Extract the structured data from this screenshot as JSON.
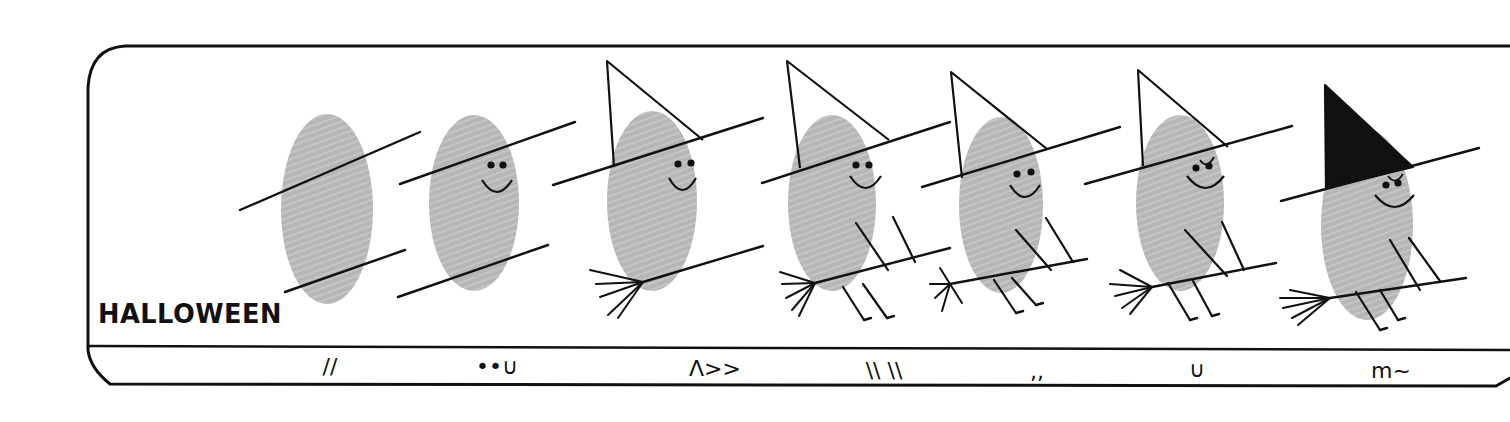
{
  "title": "HALLOWEEN",
  "colors": {
    "ink": "#111111",
    "thumbprint": "#b6b6b6",
    "paper": "#ffffff",
    "hat_dark": "#111111"
  },
  "frame": {
    "top_y": 46,
    "divider_y": 346,
    "bottom_y": 386,
    "left_x": 88,
    "right_x": 1510
  },
  "steps": [
    {
      "index": 1,
      "caption_glyph": "//",
      "print": {
        "cx": 327,
        "cy": 209,
        "rx": 46,
        "ry": 95
      },
      "lines": [
        [
          240,
          210,
          420,
          132
        ],
        [
          285,
          292,
          405,
          250
        ]
      ],
      "caption_pos": [
        330,
        368
      ],
      "face": null,
      "hat": null,
      "broom": null,
      "legs": null
    },
    {
      "index": 2,
      "caption_glyph": "••∪",
      "print": {
        "cx": 474,
        "cy": 203,
        "rx": 45,
        "ry": 88
      },
      "lines": [
        [
          400,
          184,
          575,
          122
        ],
        [
          398,
          297,
          548,
          245
        ]
      ],
      "caption_pos": [
        497,
        368
      ],
      "face": {
        "eyes": [
          [
            491,
            165
          ],
          [
            503,
            165
          ]
        ],
        "smile": [
          482,
          180,
          512,
          180
        ]
      },
      "hat": null,
      "broom": null,
      "legs": null
    },
    {
      "index": 3,
      "caption_glyph": "Λ>>",
      "print": {
        "cx": 652,
        "cy": 201,
        "rx": 45,
        "ry": 90
      },
      "lines": [
        [
          553,
          185,
          763,
          118
        ],
        [
          643,
          282,
          763,
          246
        ]
      ],
      "caption_pos": [
        715,
        370
      ],
      "face": {
        "eyes": [
          [
            678,
            164
          ],
          [
            691,
            163
          ]
        ],
        "smile": [
          669,
          178,
          696,
          178
        ]
      },
      "hat": {
        "apex": [
          607,
          61
        ],
        "left": [
          614,
          167
        ],
        "right": [
          703,
          140
        ],
        "filled": false
      },
      "broom": {
        "knot": [
          643,
          282
        ],
        "bristles": [
          [
            590,
            270
          ],
          [
            596,
            284
          ],
          [
            600,
            297
          ],
          [
            608,
            315
          ],
          [
            618,
            318
          ]
        ]
      },
      "legs": null
    },
    {
      "index": 4,
      "caption_glyph": "\\\\ \\\\",
      "print": {
        "cx": 832,
        "cy": 203,
        "rx": 44,
        "ry": 88
      },
      "lines": [
        [
          762,
          183,
          950,
          122
        ],
        [
          815,
          283,
          950,
          248
        ]
      ],
      "caption_pos": [
        884,
        372
      ],
      "face": {
        "eyes": [
          [
            856,
            165
          ],
          [
            869,
            165
          ]
        ],
        "smile": [
          850,
          176,
          881,
          176
        ]
      },
      "hat": {
        "apex": [
          787,
          61
        ],
        "left": [
          800,
          168
        ],
        "right": [
          889,
          140
        ],
        "filled": false
      },
      "broom": {
        "knot": [
          815,
          283
        ],
        "bristles": [
          [
            780,
            272
          ],
          [
            782,
            284
          ],
          [
            786,
            298
          ],
          [
            792,
            310
          ],
          [
            799,
            316
          ]
        ]
      },
      "legs": [
        [
          [
            856,
            223
          ],
          [
            888,
            270
          ]
        ],
        [
          [
            893,
            217
          ],
          [
            915,
            262
          ]
        ],
        [
          [
            843,
            287
          ],
          [
            864,
            320
          ]
        ],
        [
          [
            863,
            284
          ],
          [
            887,
            318
          ]
        ]
      ]
    },
    {
      "index": 5,
      "caption_glyph": ",,",
      "print": {
        "cx": 1001,
        "cy": 205,
        "rx": 42,
        "ry": 88
      },
      "lines": [
        [
          922,
          187,
          1120,
          127
        ],
        [
          950,
          284,
          1087,
          259
        ]
      ],
      "caption_pos": [
        1037,
        373
      ],
      "face": {
        "eyes": [
          [
            1017,
            174
          ],
          [
            1031,
            172
          ]
        ],
        "smile": [
          1010,
          185,
          1040,
          185
        ]
      },
      "hat": {
        "apex": [
          951,
          72
        ],
        "left": [
          962,
          178
        ],
        "right": [
          1047,
          149
        ],
        "filled": false
      },
      "broom": {
        "knot": [
          950,
          284
        ],
        "bristles": [
          [
            940,
            268
          ],
          [
            930,
            284
          ],
          [
            935,
            298
          ],
          [
            942,
            311
          ],
          [
            962,
            303
          ]
        ]
      },
      "legs": [
        [
          [
            1016,
            230
          ],
          [
            1051,
            270
          ]
        ],
        [
          [
            1046,
            218
          ],
          [
            1073,
            262
          ]
        ],
        [
          [
            994,
            280
          ],
          [
            1016,
            313
          ]
        ],
        [
          [
            1012,
            278
          ],
          [
            1036,
            305
          ]
        ]
      ]
    },
    {
      "index": 6,
      "caption_glyph": "∪",
      "print": {
        "cx": 1180,
        "cy": 203,
        "rx": 44,
        "ry": 88
      },
      "lines": [
        [
          1085,
          184,
          1292,
          126
        ],
        [
          1152,
          287,
          1276,
          263
        ]
      ],
      "caption_pos": [
        1197,
        371
      ],
      "face": {
        "eyes": [
          [
            1196,
            168
          ],
          [
            1209,
            166
          ]
        ],
        "smile": [
          1187,
          176,
          1224,
          176
        ],
        "nose": [
          1200,
          160,
          1214,
          157
        ]
      },
      "hat": {
        "apex": [
          1138,
          70
        ],
        "left": [
          1143,
          166
        ],
        "right": [
          1228,
          147
        ],
        "filled": false
      },
      "broom": {
        "knot": [
          1152,
          287
        ],
        "bristles": [
          [
            1120,
            270
          ],
          [
            1110,
            284
          ],
          [
            1115,
            296
          ],
          [
            1122,
            308
          ],
          [
            1130,
            314
          ]
        ]
      },
      "legs": [
        [
          [
            1185,
            230
          ],
          [
            1227,
            276
          ]
        ],
        [
          [
            1222,
            222
          ],
          [
            1244,
            270
          ]
        ],
        [
          [
            1168,
            283
          ],
          [
            1190,
            320
          ]
        ],
        [
          [
            1193,
            281
          ],
          [
            1212,
            316
          ]
        ]
      ]
    },
    {
      "index": 7,
      "caption_glyph": "m~",
      "print": {
        "cx": 1367,
        "cy": 225,
        "rx": 46,
        "ry": 95
      },
      "lines": [
        [
          1281,
          201,
          1479,
          148
        ],
        [
          1330,
          298,
          1466,
          278
        ]
      ],
      "caption_pos": [
        1391,
        372
      ],
      "face": {
        "eyes": [
          [
            1386,
            185
          ],
          [
            1398,
            183
          ]
        ],
        "smile": [
          1375,
          195,
          1414,
          195
        ],
        "nose": [
          1388,
          176,
          1403,
          174
        ]
      },
      "hat": {
        "apex": [
          1325,
          85
        ],
        "left": [
          1326,
          188
        ],
        "right": [
          1413,
          167
        ],
        "filled": true
      },
      "broom": {
        "knot": [
          1330,
          298
        ],
        "bristles": [
          [
            1290,
            290
          ],
          [
            1280,
            298
          ],
          [
            1283,
            308
          ],
          [
            1292,
            318
          ],
          [
            1298,
            325
          ]
        ]
      },
      "legs": [
        [
          [
            1390,
            240
          ],
          [
            1420,
            290
          ]
        ],
        [
          [
            1409,
            238
          ],
          [
            1440,
            281
          ]
        ],
        [
          [
            1356,
            292
          ],
          [
            1380,
            330
          ]
        ],
        [
          [
            1380,
            290
          ],
          [
            1398,
            320
          ]
        ]
      ]
    }
  ]
}
